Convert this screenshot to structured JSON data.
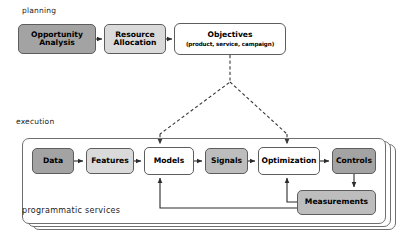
{
  "diagram": {
    "sections": {
      "planning_label": "planning",
      "execution_label": "execution",
      "programmatic_services_label": "programmatic services"
    },
    "colors": {
      "fill_dark": "#a3a3a3",
      "fill_mid": "#bdbdbd",
      "fill_light": "#dadada",
      "fill_white": "#ffffff",
      "border": "#5d5d5d",
      "connector_solid": "#2b2b2b",
      "connector_dashed": "#3a3a3a",
      "background": "#ffffff"
    },
    "planning_nodes": [
      {
        "id": "opportunity-analysis",
        "label": "Opportunity\nAnalysis",
        "line1": "Opportunity",
        "line2": "Analysis",
        "fill": "dark"
      },
      {
        "id": "resource-allocation",
        "label": "Resource\nAllocation",
        "line1": "Resource",
        "line2": "Allocation",
        "fill": "light"
      },
      {
        "id": "objectives",
        "label": "Objectives",
        "line1": "Objectives",
        "sublabel": "(product, service, campaign)",
        "fill": "white"
      }
    ],
    "execution_nodes": [
      {
        "id": "data",
        "label": "Data",
        "fill": "dark"
      },
      {
        "id": "features",
        "label": "Features",
        "fill": "light"
      },
      {
        "id": "models",
        "label": "Models",
        "fill": "white"
      },
      {
        "id": "signals",
        "label": "Signals",
        "fill": "mid"
      },
      {
        "id": "optimization",
        "label": "Optimization",
        "fill": "white"
      },
      {
        "id": "controls",
        "label": "Controls",
        "fill": "dark"
      },
      {
        "id": "measurements",
        "label": "Measurements",
        "fill": "mid"
      }
    ],
    "connectors": [
      {
        "from": "opportunity-analysis",
        "to": "resource-allocation",
        "style": "solid",
        "arrow": true
      },
      {
        "from": "resource-allocation",
        "to": "objectives",
        "style": "solid",
        "arrow": true
      },
      {
        "from": "objectives",
        "to": "models",
        "style": "dashed",
        "arrow": true
      },
      {
        "from": "objectives",
        "to": "optimization",
        "style": "dashed",
        "arrow": true
      },
      {
        "from": "data",
        "to": "features",
        "style": "solid",
        "arrow": true
      },
      {
        "from": "features",
        "to": "models",
        "style": "solid",
        "arrow": true
      },
      {
        "from": "models",
        "to": "signals",
        "style": "solid",
        "arrow": true
      },
      {
        "from": "signals",
        "to": "optimization",
        "style": "solid",
        "arrow": true
      },
      {
        "from": "optimization",
        "to": "controls",
        "style": "solid",
        "arrow": true
      },
      {
        "from": "controls",
        "to": "measurements",
        "style": "solid",
        "arrow": true
      },
      {
        "from": "measurements",
        "to": "optimization",
        "style": "solid",
        "arrow": true
      },
      {
        "from": "measurements",
        "to": "models",
        "style": "solid",
        "arrow": true
      }
    ],
    "stack_cards": 3
  }
}
